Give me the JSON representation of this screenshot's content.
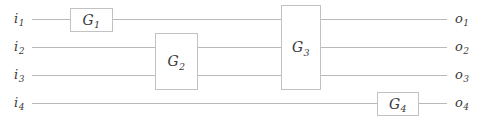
{
  "diagram": {
    "type": "circuit-diagram",
    "width": 482,
    "height": 122,
    "colors": {
      "background": "#ffffff",
      "wire": "#b9b9b9",
      "box_border": "#c2c2c2",
      "box_fill": "#ffffff",
      "text": "#3a3a3a"
    }
  },
  "wires": [
    {
      "id": "wire-1",
      "y": 19,
      "input_label": "i",
      "input_sub": "1",
      "output_label": "o",
      "output_sub": "1"
    },
    {
      "id": "wire-2",
      "y": 47,
      "input_label": "i",
      "input_sub": "2",
      "output_label": "o",
      "output_sub": "2"
    },
    {
      "id": "wire-3",
      "y": 75,
      "input_label": "i",
      "input_sub": "3",
      "output_label": "o",
      "output_sub": "3"
    },
    {
      "id": "wire-4",
      "y": 103,
      "input_label": "i",
      "input_sub": "4",
      "output_label": "o",
      "output_sub": "4"
    }
  ],
  "gates": [
    {
      "id": "gate-1",
      "label": "G",
      "sub": "1",
      "x": 70,
      "y": 8,
      "width": 42,
      "height": 23,
      "wires": [
        1
      ]
    },
    {
      "id": "gate-2",
      "label": "G",
      "sub": "2",
      "x": 155,
      "y": 33,
      "width": 42,
      "height": 56,
      "wires": [
        2,
        3
      ]
    },
    {
      "id": "gate-3",
      "label": "G",
      "sub": "3",
      "x": 281,
      "y": 5,
      "width": 39,
      "height": 84,
      "wires": [
        1,
        2,
        3
      ]
    },
    {
      "id": "gate-4",
      "label": "G",
      "sub": "4",
      "x": 377,
      "y": 92,
      "width": 41,
      "height": 23,
      "wires": [
        4
      ]
    }
  ],
  "geometry": {
    "wire_start_x": 32,
    "wire_end_x": 447,
    "input_label_x": 14,
    "output_label_x": 455
  }
}
